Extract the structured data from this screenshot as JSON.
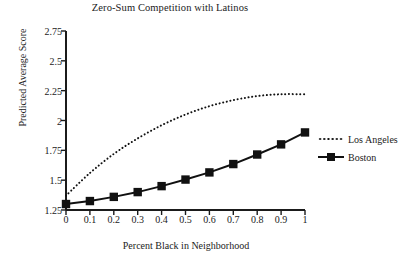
{
  "chart_data": {
    "type": "line",
    "title": "Zero-Sum Competition with Latinos",
    "xlabel": "Percent Black in Neighborhood",
    "ylabel": "Predicted Average Score",
    "x": [
      0,
      0.1,
      0.2,
      0.3,
      0.4,
      0.5,
      0.6,
      0.7,
      0.8,
      0.9,
      1
    ],
    "xtick_labels": [
      "0",
      "0.1",
      "0.2",
      "0.3",
      "0.4",
      "0.5",
      "0.6",
      "0.7",
      "0.8",
      "0.9",
      "1"
    ],
    "ytick_labels": [
      "1.25",
      "1.5",
      "1.75",
      "2",
      "2.25",
      "2.5",
      "2.75"
    ],
    "ytick_values": [
      1.25,
      1.5,
      1.75,
      2,
      2.25,
      2.5,
      2.75
    ],
    "xlim": [
      0,
      1
    ],
    "ylim": [
      1.25,
      2.75
    ],
    "grid": false,
    "legend_position": "right",
    "series": [
      {
        "name": "Los Angeles",
        "style": "dotted",
        "marker": "none",
        "color": "#111111",
        "values": [
          1.37,
          1.56,
          1.72,
          1.85,
          1.96,
          2.05,
          2.12,
          2.17,
          2.205,
          2.22,
          2.22
        ]
      },
      {
        "name": "Boston",
        "style": "solid",
        "marker": "square",
        "color": "#111111",
        "values": [
          1.3,
          1.325,
          1.36,
          1.4,
          1.45,
          1.505,
          1.565,
          1.635,
          1.715,
          1.8,
          1.9
        ]
      }
    ]
  },
  "legend": {
    "items": [
      {
        "label": "Los Angeles"
      },
      {
        "label": "Boston"
      }
    ]
  },
  "colors": {
    "axis": "#1b1b1b",
    "series": "#111111",
    "background": "#ffffff"
  }
}
